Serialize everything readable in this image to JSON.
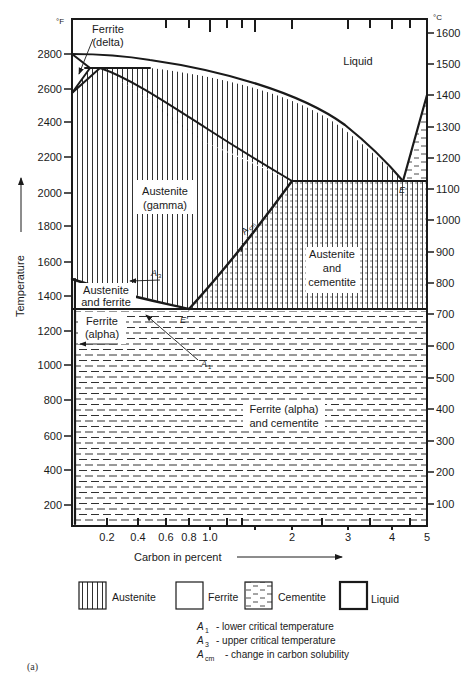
{
  "figure": {
    "caption": "(a)",
    "left_axis_unit": "°F",
    "right_axis_unit": "°C",
    "y_axis_label": "Temperature",
    "x_axis_label": "Carbon in percent"
  },
  "axes": {
    "fahrenheit_ticks": [
      "2800",
      "2600",
      "2400",
      "2200",
      "2000",
      "1800",
      "1600",
      "1400",
      "1200",
      "1000",
      "800",
      "600",
      "400",
      "200"
    ],
    "celsius_ticks": [
      "1600",
      "1500",
      "1400",
      "1300",
      "1200",
      "1100",
      "1000",
      "900",
      "800",
      "700",
      "600",
      "500",
      "400",
      "300",
      "200",
      "100"
    ],
    "carbon_ticks": [
      "0.2",
      "0.4",
      "0.6",
      "0.8",
      "1.0",
      "2",
      "3",
      "4",
      "5"
    ]
  },
  "regions": {
    "liquid": "Liquid",
    "ferrite_delta_1": "Ferrite",
    "ferrite_delta_2": "(delta)",
    "austenite_1": "Austenite",
    "austenite_2": "(gamma)",
    "austenite_ferrite_1": "Austenite",
    "austenite_ferrite_2": "and ferrite",
    "ferrite_alpha_1": "Ferrite",
    "ferrite_alpha_2": "(alpha)",
    "austenite_cementite_1": "Austenite",
    "austenite_cementite_2": "and",
    "austenite_cementite_3": "cementite",
    "ferrite_cementite_1": "Ferrite (alpha)",
    "ferrite_cementite_2": "and cementite"
  },
  "points": {
    "eutectic": "E",
    "eutectoid": "E'"
  },
  "lines": {
    "a1": "A",
    "a1_sub": "1",
    "a3": "A",
    "a3_sub": "3",
    "acm": "A",
    "acm_sub": "cm"
  },
  "legend": {
    "items": [
      {
        "label": "Austenite",
        "pattern": "vertical-lines"
      },
      {
        "label": "Ferrite",
        "pattern": "blank"
      },
      {
        "label": "Cementite",
        "pattern": "dashes"
      },
      {
        "label": "Liquid",
        "pattern": "blank-heavy-border"
      }
    ],
    "notes": [
      {
        "symbol": "A",
        "sub": "1",
        "text": "-  lower critical temperature"
      },
      {
        "symbol": "A",
        "sub": "3",
        "text": "-  upper critical temperature"
      },
      {
        "symbol": "A",
        "sub": "cm",
        "text": "-  change in carbon solubility"
      }
    ]
  },
  "colors": {
    "ink": "#1a1a1a",
    "background": "#ffffff"
  }
}
